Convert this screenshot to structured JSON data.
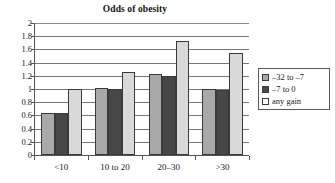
{
  "chart_data": {
    "type": "bar",
    "title": "Odds of obesity",
    "xlabel": "",
    "ylabel": "",
    "ylim": [
      0,
      2
    ],
    "ytick_step": 0.2,
    "yticks": [
      "2",
      "1.8",
      "1.6",
      "1.4",
      "1.2",
      "1",
      "0.8",
      "0.6",
      "0.4",
      "0.2",
      "0"
    ],
    "grid": true,
    "legend_position": "right",
    "categories": [
      "<10",
      "10 to 20",
      "20–30",
      ">30"
    ],
    "series": [
      {
        "name": "–32 to –7",
        "color": "#a9a9a9",
        "values": [
          0.63,
          1.01,
          1.23,
          1.0
        ]
      },
      {
        "name": "–7 to 0",
        "color": "#474747",
        "values": [
          0.63,
          1.0,
          1.19,
          0.99
        ]
      },
      {
        "name": "any gain",
        "color": "#d9d9d9",
        "values": [
          1.0,
          1.26,
          1.73,
          1.55
        ]
      }
    ]
  }
}
